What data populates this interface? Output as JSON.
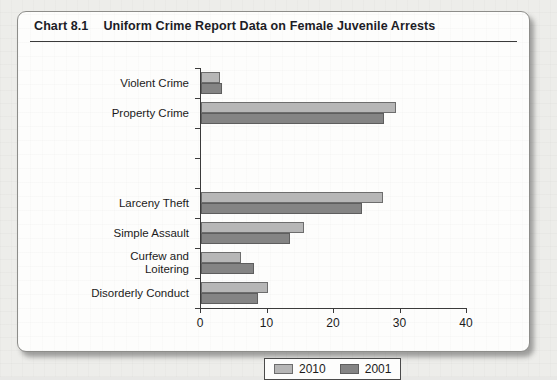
{
  "card": {
    "chart_number": "Chart 8.1",
    "title": "Uniform Crime Report Data on Female Juvenile Arrests"
  },
  "chart_data": {
    "type": "bar",
    "orientation": "horizontal",
    "title": "Uniform Crime Report Data on Female Juvenile Arrests",
    "xlabel": "",
    "ylabel": "",
    "xlim": [
      0,
      40
    ],
    "xticks": [
      0,
      10,
      20,
      30,
      40
    ],
    "xtick_labels": [
      "0",
      "10",
      "20",
      "30",
      "40"
    ],
    "grid": false,
    "legend_position": "bottom-center",
    "categories": [
      "Violent Crime",
      "Property Crime",
      "",
      "",
      "Larceny Theft",
      "Simple Assault",
      "Curfew and\nLoitering",
      "Disorderly Conduct"
    ],
    "series": [
      {
        "name": "2010",
        "color": "#b6b6b6",
        "values": [
          2.8,
          29.3,
          null,
          null,
          27.4,
          15.5,
          6.0,
          10.0
        ]
      },
      {
        "name": "2001",
        "color": "#848484",
        "values": [
          3.2,
          27.5,
          null,
          null,
          24.2,
          13.4,
          8.0,
          8.6
        ]
      }
    ],
    "legend": [
      "2010",
      "2001"
    ]
  },
  "legend": {
    "items": [
      {
        "label": "2010",
        "color": "#b6b6b6"
      },
      {
        "label": "2001",
        "color": "#848484"
      }
    ]
  }
}
